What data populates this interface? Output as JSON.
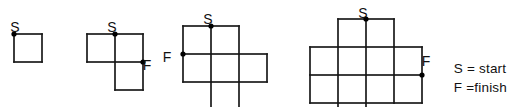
{
  "figure": {
    "title": "",
    "background_color": "#ffffff",
    "stroke_color": "#1a1a1a",
    "marker_color": "#000000",
    "cell_size": 28,
    "stroke_width": 1.7,
    "marker_radius": 2.6,
    "labels": {
      "start": "S",
      "finish": "F"
    },
    "shapes": [
      {
        "name": "shape-1-single-square",
        "index": 1,
        "origin_x": 14,
        "origin_y": 34,
        "cols": 1,
        "rows": 1,
        "cells": [
          [
            0,
            0
          ]
        ],
        "start_label": "S",
        "start_label_x": 15,
        "start_label_y": 22,
        "start_point": [
          0,
          0
        ],
        "finish_label": null,
        "finish_label_x": null,
        "finish_label_y": null,
        "finish_point": null
      },
      {
        "name": "shape-2-l-tromino",
        "index": 2,
        "origin_x": 87,
        "origin_y": 34,
        "cols": 2,
        "rows": 2,
        "cells": [
          [
            0,
            0
          ],
          [
            1,
            0
          ],
          [
            1,
            1
          ]
        ],
        "start_label": "S",
        "start_label_x": 112,
        "start_label_y": 22,
        "start_point": [
          1,
          0
        ],
        "finish_label": "F",
        "finish_label_x": 147,
        "finish_label_y": 66,
        "finish_point": [
          2,
          1
        ]
      },
      {
        "name": "shape-3-six-cell-cross",
        "index": 3,
        "origin_x": 183,
        "origin_y": 26,
        "cols": 3,
        "rows": 3,
        "cells": [
          [
            0,
            0
          ],
          [
            1,
            0
          ],
          [
            0,
            1
          ],
          [
            1,
            1
          ],
          [
            2,
            1
          ],
          [
            1,
            2
          ]
        ],
        "start_label": "S",
        "start_label_x": 208,
        "start_label_y": 14,
        "start_point": [
          1,
          0
        ],
        "finish_label": "F",
        "finish_label_x": 167,
        "finish_label_y": 58,
        "finish_point": [
          0,
          1
        ]
      },
      {
        "name": "shape-4-eleven-cell-cross",
        "index": 4,
        "origin_x": 310,
        "origin_y": 19,
        "cols": 4,
        "rows": 4,
        "cells": [
          [
            1,
            0
          ],
          [
            2,
            0
          ],
          [
            0,
            1
          ],
          [
            1,
            1
          ],
          [
            2,
            1
          ],
          [
            3,
            1
          ],
          [
            0,
            2
          ],
          [
            1,
            2
          ],
          [
            2,
            2
          ],
          [
            3,
            2
          ],
          [
            1,
            3
          ]
        ],
        "start_label": "S",
        "start_label_x": 363,
        "start_label_y": 8,
        "start_point": [
          2,
          0
        ],
        "finish_label": "F",
        "finish_label_x": 426,
        "finish_label_y": 62,
        "finish_point": [
          4,
          2
        ]
      }
    ]
  },
  "legend": {
    "name": "legend",
    "lines": [
      "S = start",
      "F =finish"
    ],
    "start_line": "S = start",
    "finish_line": "F =finish"
  }
}
